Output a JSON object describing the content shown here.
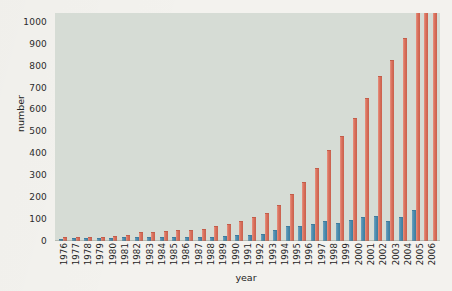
{
  "chart_data": {
    "type": "bar",
    "title": "",
    "xlabel": "year",
    "ylabel": "number",
    "ylim": [
      0,
      1040
    ],
    "grid": false,
    "legend": null,
    "y_ticks": [
      0,
      100,
      200,
      300,
      400,
      500,
      600,
      700,
      800,
      900,
      1000
    ],
    "categories": [
      "1976",
      "1977",
      "1978",
      "1979",
      "1980",
      "1981",
      "1982",
      "1983",
      "1984",
      "1985",
      "1986",
      "1987",
      "1988",
      "1989",
      "1990",
      "1991",
      "1992",
      "1993",
      "1994",
      "1995",
      "1996",
      "1997",
      "1998",
      "1999",
      "2000",
      "2001",
      "2002",
      "2003",
      "2004",
      "2005",
      "2006"
    ],
    "series": [
      {
        "name": "blue",
        "color": "#4e8cae",
        "values": [
          5,
          8,
          7,
          7,
          9,
          12,
          16,
          12,
          13,
          13,
          14,
          15,
          16,
          17,
          21,
          25,
          27,
          45,
          62,
          63,
          73,
          88,
          78,
          92,
          104,
          108,
          89,
          106,
          135,
          0,
          0
        ]
      },
      {
        "name": "red",
        "color": "#d9705c",
        "values": [
          12,
          15,
          16,
          15,
          17,
          22,
          38,
          36,
          42,
          45,
          47,
          52,
          66,
          75,
          86,
          104,
          123,
          158,
          208,
          263,
          330,
          409,
          474,
          555,
          650,
          748,
          820,
          920,
          1040,
          1040,
          1040
        ]
      }
    ],
    "notes": {
      "clipped_bars": [
        "2004",
        "2005",
        "2006"
      ],
      "clip_value": 1040
    }
  },
  "style": {
    "plot_background": "#d6dcd5",
    "page_background": "#f3f2ee",
    "blue": "#4e8cae",
    "red": "#d9705c",
    "text": "#232323"
  }
}
